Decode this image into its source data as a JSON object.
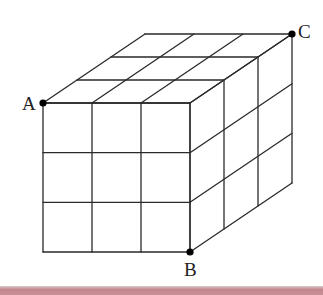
{
  "diagram": {
    "type": "3x3x3 cube grid (oblique projection)",
    "grid": {
      "n": 3
    },
    "geometry": {
      "front_origin": [
        43,
        103
      ],
      "front_size": [
        147,
        149
      ],
      "depth_vector": [
        102,
        -69
      ]
    },
    "points": [
      {
        "id": "A",
        "label": "A",
        "pos": [
          43,
          103
        ],
        "label_pos": [
          22,
          110
        ]
      },
      {
        "id": "B",
        "label": "B",
        "pos": [
          190,
          252
        ],
        "label_pos": [
          184,
          276
        ]
      },
      {
        "id": "C",
        "label": "C",
        "pos": [
          292,
          34
        ],
        "label_pos": [
          298,
          38
        ]
      }
    ],
    "colors": {
      "line": "#2a2a2a",
      "point": "#000000",
      "bottom_bar": "#c4868f"
    }
  }
}
